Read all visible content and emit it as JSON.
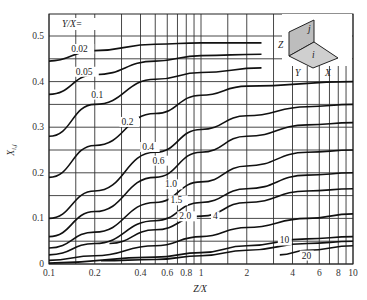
{
  "chart_data": {
    "type": "line",
    "title": "",
    "xlabel": "Z/X",
    "ylabel": "X_{i,j}",
    "xscale": "log",
    "xlim": [
      0.1,
      10
    ],
    "ylim": [
      0,
      0.5
    ],
    "grid": true,
    "x_ticks": [
      "0.1",
      "0.2",
      "0.4",
      "0.6",
      "0.8",
      "1",
      "2",
      "4",
      "6",
      "8",
      "10"
    ],
    "y_ticks": [
      "0",
      "0.1",
      "0.2",
      "0.3",
      "0.4",
      "0.5"
    ],
    "legend_title": "Y/X=",
    "inset": {
      "labels": [
        "Z",
        "j",
        "i",
        "Y",
        "X"
      ]
    },
    "series": [
      {
        "name": "0.02",
        "x": [
          0.1,
          0.2,
          0.5,
          1,
          2.5
        ],
        "y": [
          0.445,
          0.468,
          0.482,
          0.485,
          0.485
        ]
      },
      {
        "name": "0.05",
        "x": [
          0.1,
          0.2,
          0.5,
          1,
          2.5
        ],
        "y": [
          0.372,
          0.415,
          0.445,
          0.457,
          0.46
        ]
      },
      {
        "name": "0.1",
        "x": [
          0.1,
          0.2,
          0.5,
          1,
          2.5
        ],
        "y": [
          0.28,
          0.35,
          0.405,
          0.42,
          0.43
        ]
      },
      {
        "name": "0.2",
        "x": [
          0.1,
          0.2,
          0.5,
          1,
          2,
          10
        ],
        "y": [
          0.19,
          0.26,
          0.33,
          0.37,
          0.39,
          0.4
        ]
      },
      {
        "name": "0.4",
        "x": [
          0.1,
          0.2,
          0.5,
          1,
          2,
          5,
          10
        ],
        "y": [
          0.1,
          0.16,
          0.245,
          0.295,
          0.325,
          0.345,
          0.35
        ]
      },
      {
        "name": "0.6",
        "x": [
          0.1,
          0.2,
          0.5,
          1,
          2,
          5,
          10
        ],
        "y": [
          0.06,
          0.115,
          0.19,
          0.245,
          0.28,
          0.305,
          0.31
        ]
      },
      {
        "name": "1.0",
        "x": [
          0.1,
          0.2,
          0.5,
          1,
          2,
          5,
          10
        ],
        "y": [
          0.035,
          0.07,
          0.135,
          0.18,
          0.215,
          0.245,
          0.25
        ]
      },
      {
        "name": "1.5",
        "x": [
          0.1,
          0.2,
          0.5,
          1,
          2,
          5,
          10
        ],
        "y": [
          0.02,
          0.045,
          0.095,
          0.135,
          0.165,
          0.195,
          0.2
        ]
      },
      {
        "name": "2.0",
        "x": [
          0.25,
          0.5,
          1,
          2,
          5,
          10
        ],
        "y": [
          0.045,
          0.075,
          0.105,
          0.135,
          0.16,
          0.165
        ]
      },
      {
        "name": "4",
        "x": [
          0.1,
          0.2,
          0.5,
          1,
          2,
          5,
          10
        ],
        "y": [
          0.008,
          0.018,
          0.04,
          0.06,
          0.08,
          0.1,
          0.11
        ]
      },
      {
        "name": "10",
        "x": [
          0.1,
          0.5,
          1,
          2,
          5,
          10
        ],
        "y": [
          0.002,
          0.015,
          0.025,
          0.04,
          0.055,
          0.06
        ]
      },
      {
        "name": "20",
        "x": [
          3.3,
          5,
          10
        ],
        "y": [
          0.02,
          0.03,
          0.04
        ]
      },
      {
        "name": "unlabeled-low",
        "x": [
          0.22,
          0.5,
          1,
          2,
          5,
          10
        ],
        "y": [
          0.007,
          0.01,
          0.018,
          0.03,
          0.045,
          0.05
        ]
      }
    ],
    "labels": [
      {
        "text": "0.02",
        "x": 0.14,
        "y": 0.465
      },
      {
        "text": "0.05",
        "x": 0.15,
        "y": 0.415
      },
      {
        "text": "0.1",
        "x": 0.19,
        "y": 0.365
      },
      {
        "text": "0.2",
        "x": 0.3,
        "y": 0.305
      },
      {
        "text": "0.4",
        "x": 0.41,
        "y": 0.25
      },
      {
        "text": "0.6",
        "x": 0.48,
        "y": 0.22
      },
      {
        "text": "1.0",
        "x": 0.58,
        "y": 0.168
      },
      {
        "text": "1.5",
        "x": 0.63,
        "y": 0.133
      },
      {
        "text": "2.0",
        "x": 0.72,
        "y": 0.098
      },
      {
        "text": "4",
        "x": 1.2,
        "y": 0.098
      },
      {
        "text": "10",
        "x": 3.3,
        "y": 0.045
      },
      {
        "text": "20",
        "x": 4.6,
        "y": 0.012
      }
    ]
  }
}
